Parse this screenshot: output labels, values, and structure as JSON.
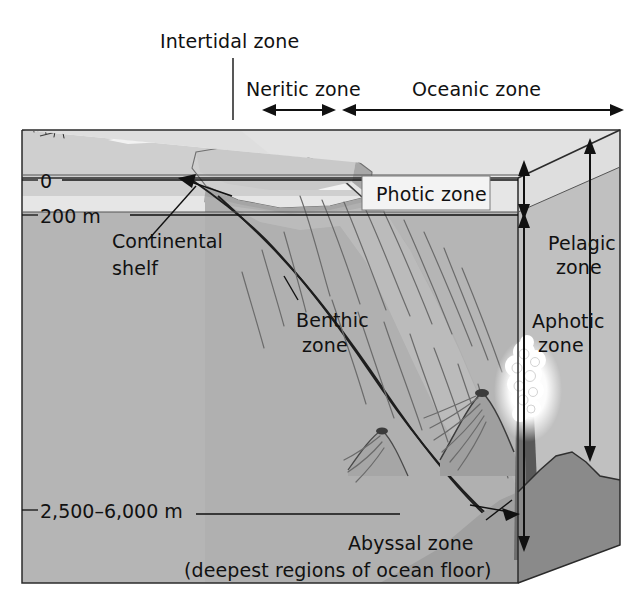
{
  "figure": {
    "type": "diagram"
  },
  "labels": {
    "intertidal_zone": "Intertidal zone",
    "neritic_zone": "Neritic zone",
    "oceanic_zone": "Oceanic zone",
    "photic_zone": "Photic zone",
    "aphotic_zone_line1": "Aphotic",
    "aphotic_zone_line2": "zone",
    "pelagic_zone_line1": "Pelagic",
    "pelagic_zone_line2": "zone",
    "benthic_zone_line1": "Benthic",
    "benthic_zone_line2": "zone",
    "continental_shelf_line1": "Continental",
    "continental_shelf_line2": "shelf",
    "abyssal_zone": "Abyssal zone",
    "abyssal_zone_sub": "(deepest regions of ocean floor)"
  },
  "depth_scale": {
    "ticks": [
      {
        "label": "0",
        "depth_m": 0
      },
      {
        "label": "200 m",
        "depth_m": 200
      },
      {
        "label": "2,500–6,000 m",
        "depth_m": 2500
      }
    ]
  },
  "colors": {
    "background": "#ffffff",
    "water_body": "#b5b5b5",
    "photic_band": "#e8e8e8",
    "top_face": "#dcdcdc",
    "right_face_upper": "#c3c3c3",
    "right_face_lower": "#8e8e8e",
    "seafloor_dark": "#7c7c7c",
    "shelf_light": "#efefef",
    "shelf_mid": "#c9c9c9",
    "land": "#d9d9d9",
    "vent_plume": "#ffffff",
    "outline": "#2b2b2b",
    "text": "#111111"
  }
}
